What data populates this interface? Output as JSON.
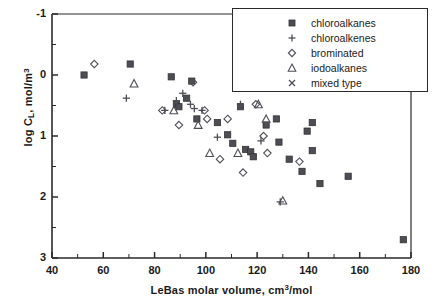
{
  "chart_data": {
    "type": "scatter",
    "title": "",
    "xlabel": "LeBas molar volume, cm3/mol",
    "ylabel": "log CL, mol/m3",
    "xlim": [
      40,
      180
    ],
    "ylim": [
      -1,
      3
    ],
    "xticks": [
      40,
      60,
      80,
      100,
      120,
      140,
      160,
      180
    ],
    "yticks": [
      -1,
      0,
      1,
      2,
      3
    ],
    "xminor_step": 10,
    "yminor_step": 0.5,
    "grid": false,
    "legend_position": "top-right",
    "series": [
      {
        "name": "chloroalkanes",
        "marker": "filled-square",
        "color": "#4d4d55",
        "points": [
          [
            52.5,
            2.0
          ],
          [
            70.5,
            2.18
          ],
          [
            86.5,
            1.97
          ],
          [
            88.5,
            1.52
          ],
          [
            89.5,
            1.48
          ],
          [
            92.5,
            1.62
          ],
          [
            94.5,
            1.9
          ],
          [
            96.5,
            1.28
          ],
          [
            104.5,
            1.22
          ],
          [
            108.5,
            1.02
          ],
          [
            110.5,
            0.88
          ],
          [
            113.5,
            1.48
          ],
          [
            115.5,
            0.78
          ],
          [
            117.5,
            0.74
          ],
          [
            118.5,
            0.66
          ],
          [
            123.5,
            1.18
          ],
          [
            127.5,
            1.28
          ],
          [
            128.5,
            0.9
          ],
          [
            132.5,
            0.62
          ],
          [
            137.5,
            0.42
          ],
          [
            139.5,
            1.08
          ],
          [
            141.5,
            1.22
          ],
          [
            141.5,
            0.76
          ],
          [
            144.5,
            0.22
          ],
          [
            155.5,
            0.34
          ],
          [
            177.0,
            -0.7
          ]
        ]
      },
      {
        "name": "chloroalkenes",
        "marker": "plus",
        "color": "#4d4d55",
        "points": [
          [
            69.0,
            1.62
          ],
          [
            84.0,
            1.42
          ],
          [
            88.5,
            1.58
          ],
          [
            91.0,
            1.7
          ],
          [
            94.0,
            1.52
          ],
          [
            95.5,
            1.45
          ],
          [
            98.5,
            1.42
          ],
          [
            104.5,
            0.98
          ],
          [
            113.5,
            1.52
          ],
          [
            121.5,
            0.92
          ],
          [
            129.0,
            -0.08
          ]
        ]
      },
      {
        "name": "brominated",
        "marker": "open-diamond",
        "color": "#4d4d55",
        "points": [
          [
            56.5,
            2.18
          ],
          [
            83.0,
            1.42
          ],
          [
            89.5,
            1.18
          ],
          [
            95.0,
            1.88
          ],
          [
            99.5,
            1.42
          ],
          [
            100.5,
            1.28
          ],
          [
            105.5,
            0.62
          ],
          [
            108.5,
            1.28
          ],
          [
            114.5,
            0.4
          ],
          [
            119.5,
            1.52
          ],
          [
            122.5,
            1.0
          ],
          [
            124.0,
            0.72
          ],
          [
            136.5,
            0.58
          ]
        ]
      },
      {
        "name": "iodoalkanes",
        "marker": "open-triangle",
        "color": "#4d4d55",
        "points": [
          [
            72.0,
            1.86
          ],
          [
            87.5,
            1.42
          ],
          [
            97.0,
            1.18
          ],
          [
            101.5,
            0.72
          ],
          [
            112.5,
            0.72
          ],
          [
            120.5,
            1.52
          ],
          [
            123.5,
            1.28
          ],
          [
            130.0,
            -0.06
          ]
        ]
      },
      {
        "name": "mixed type",
        "marker": "cross-x",
        "color": "#4d4d55",
        "points": []
      }
    ]
  },
  "axes": {
    "ylabel_main": "log C",
    "ylabel_sub": "L",
    "ylabel_rest": ", mol/m",
    "ylabel_sup": "3",
    "xlabel_main": "LeBas molar volume, cm",
    "xlabel_sup": "3",
    "xlabel_rest": "/mol",
    "ytick_labels": [
      "3",
      "2",
      "1",
      "0",
      "-1"
    ],
    "xtick_labels": [
      "40",
      "60",
      "80",
      "100",
      "120",
      "140",
      "160",
      "180"
    ]
  },
  "legend": {
    "items": [
      {
        "label": "chloroalkanes",
        "marker": "filled-square"
      },
      {
        "label": "chloroalkenes",
        "marker": "plus"
      },
      {
        "label": "brominated",
        "marker": "open-diamond"
      },
      {
        "label": "iodoalkanes",
        "marker": "open-triangle"
      },
      {
        "label": "mixed type",
        "marker": "cross-x"
      }
    ]
  },
  "style": {
    "axis_color": "#2a2a2a",
    "marker_color": "#4d4d55",
    "background": "#ffffff"
  }
}
